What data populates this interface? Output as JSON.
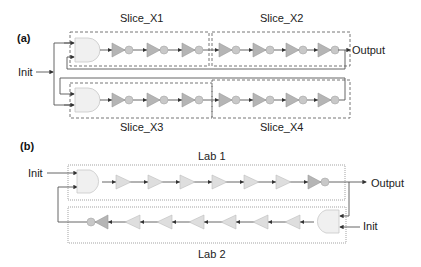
{
  "panel_a": {
    "label": "(a)",
    "input_label": "Init",
    "output_label": "Output",
    "slices": [
      {
        "name": "Slice_X1",
        "position": "top-left",
        "elements": [
          "AND gate",
          "inverter",
          "inverter",
          "inverter"
        ]
      },
      {
        "name": "Slice_X2",
        "position": "top-right",
        "elements": [
          "inverter",
          "inverter",
          "inverter",
          "inverter"
        ]
      },
      {
        "name": "Slice_X3",
        "position": "bottom-left",
        "elements": [
          "AND gate",
          "inverter",
          "inverter",
          "inverter"
        ]
      },
      {
        "name": "Slice_X4",
        "position": "bottom-right",
        "elements": [
          "inverter",
          "inverter",
          "inverter",
          "inverter"
        ]
      }
    ]
  },
  "panel_b": {
    "label": "(b)",
    "input_label_top": "Init",
    "input_label_bottom": "Init",
    "output_label": "Output",
    "labs": [
      {
        "name": "Lab 1",
        "elements": [
          "AND gate",
          "buffer",
          "buffer",
          "buffer",
          "buffer",
          "buffer",
          "buffer",
          "buffer",
          "inverter"
        ]
      },
      {
        "name": "Lab 2",
        "elements": [
          "AND gate",
          "buffer",
          "buffer",
          "buffer",
          "buffer",
          "buffer",
          "buffer",
          "buffer",
          "inverter"
        ]
      }
    ]
  },
  "colors": {
    "gate_fill": "#f0f0f0",
    "inverter_fill": "#b5b5b5",
    "buffer_fill": "#dedede",
    "wire": "#555555"
  }
}
